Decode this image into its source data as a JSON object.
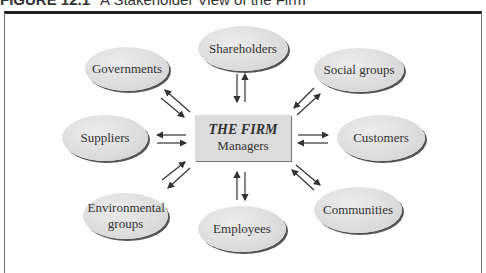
{
  "figure": {
    "label": "FIGURE 12.1",
    "title": "A Stakeholder View of the Firm"
  },
  "center": {
    "title": "THE FIRM",
    "subtitle": "Managers"
  },
  "stakeholders": [
    {
      "id": "shareholders",
      "label": "Shareholders"
    },
    {
      "id": "governments",
      "label": "Governments"
    },
    {
      "id": "social-groups",
      "label": "Social groups"
    },
    {
      "id": "suppliers",
      "label": "Suppliers"
    },
    {
      "id": "customers",
      "label": "Customers"
    },
    {
      "id": "environmental-groups",
      "label": "Environmental groups"
    },
    {
      "id": "employees",
      "label": "Employees"
    },
    {
      "id": "communities",
      "label": "Communities"
    }
  ]
}
